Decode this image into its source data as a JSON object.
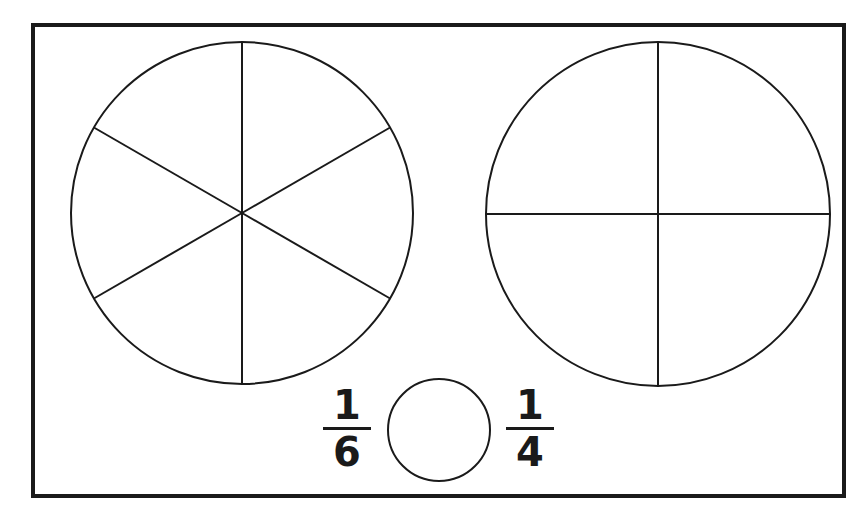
{
  "diagram": {
    "stroke_color": "#1a1a1a",
    "background": "#ffffff",
    "frame": {
      "x": 33,
      "y": 25,
      "width": 811,
      "height": 471,
      "stroke_width": 4
    },
    "circles": [
      {
        "name": "sixths-circle",
        "cx": 242,
        "cy": 213,
        "r": 171,
        "divisions": 6,
        "start_angle_deg": 90
      },
      {
        "name": "quarters-circle",
        "cx": 658,
        "cy": 214,
        "r": 172,
        "divisions": 4,
        "start_angle_deg": 0
      },
      {
        "name": "blank-circle",
        "cx": 439,
        "cy": 430,
        "r": 51,
        "divisions": 0
      }
    ],
    "fractions": [
      {
        "name": "fraction-one-sixth",
        "numerator": "1",
        "denominator": "6",
        "x": 317,
        "y": 385
      },
      {
        "name": "fraction-one-quarter",
        "numerator": "1",
        "denominator": "4",
        "x": 500,
        "y": 385
      }
    ]
  }
}
